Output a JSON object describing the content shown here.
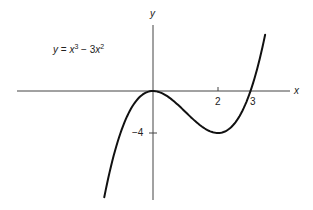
{
  "chart_data": {
    "type": "line",
    "title": "",
    "equation": "y = x³ − 3x²",
    "xlabel": "x",
    "ylabel": "y",
    "x_ticks": [
      {
        "value": 2,
        "label": "2"
      },
      {
        "value": 3,
        "label": "3"
      }
    ],
    "y_ticks": [
      {
        "value": -4,
        "label": "−4"
      }
    ],
    "grid": false,
    "legend": "none",
    "xlim": [
      -4.2,
      4.3
    ],
    "ylim": [
      -10.3,
      6.3
    ],
    "series": [
      {
        "name": "y = x³ − 3x²",
        "x": [
          -1.5,
          -1.25,
          -1.0,
          -0.75,
          -0.5,
          -0.25,
          0,
          0.25,
          0.5,
          0.75,
          1.0,
          1.25,
          1.5,
          1.75,
          2.0,
          2.25,
          2.5,
          2.75,
          3.0,
          3.25,
          3.45
        ],
        "y": [
          -10.13,
          -6.64,
          -4.0,
          -2.11,
          -0.88,
          -0.2,
          0,
          -0.17,
          -0.63,
          -1.27,
          -2.0,
          -2.73,
          -3.38,
          -3.83,
          -4.0,
          -3.8,
          -3.13,
          -1.89,
          0,
          2.64,
          5.35
        ]
      }
    ],
    "key_points": [
      {
        "label": "local max",
        "x": 0,
        "y": 0
      },
      {
        "label": "local min",
        "x": 2,
        "y": -4
      },
      {
        "label": "x-intercept",
        "x": 3,
        "y": 0
      }
    ]
  },
  "labels": {
    "x_axis": "x",
    "y_axis": "y",
    "tick_2": "2",
    "tick_3": "3",
    "tick_neg4": "−4",
    "eq_y": "y",
    "eq_eq": " = ",
    "eq_x1": "x",
    "eq_p1": "3",
    "eq_minus": " − 3",
    "eq_x2": "x",
    "eq_p2": "2"
  }
}
